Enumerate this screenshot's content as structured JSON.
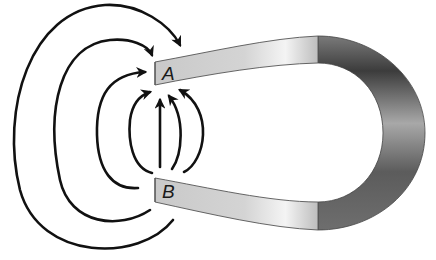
{
  "diagram": {
    "type": "horseshoe-magnet-field",
    "poles": [
      {
        "id": "A",
        "label": "A",
        "position": "top"
      },
      {
        "id": "B",
        "label": "B",
        "position": "bottom"
      }
    ],
    "field_lines": {
      "count": 7,
      "direction": "from B to A",
      "arrowheads_at": "A"
    },
    "colors": {
      "line": "#111111",
      "pole_face": "#d6d6d6",
      "arm_light": "#f2f2f2",
      "bend_dark": "#3a3a3a",
      "background": "#ffffff"
    }
  }
}
